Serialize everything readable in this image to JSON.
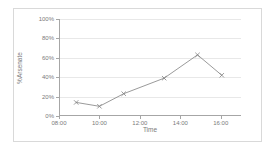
{
  "chart_data": {
    "type": "line",
    "title": "",
    "xlabel": "Time",
    "ylabel": "%Arsenate",
    "xlim": [
      8,
      17
    ],
    "ylim": [
      0,
      100
    ],
    "grid": true,
    "legend": false,
    "y_ticks": [
      "0%",
      "20%",
      "40%",
      "60%",
      "80%",
      "100%"
    ],
    "y_tick_values": [
      0,
      20,
      40,
      60,
      80,
      100
    ],
    "x_ticks": [
      "08:00",
      "10:00",
      "12:00",
      "14:00",
      "16:00"
    ],
    "x_tick_values": [
      8,
      10,
      12,
      14,
      16
    ],
    "marker": "x",
    "series": [
      {
        "name": "%Arsenate",
        "color": "#808080",
        "x": [
          8.85,
          10.0,
          11.2,
          13.2,
          14.85,
          16.05
        ],
        "x_labels": [
          "08:51",
          "10:00",
          "11:12",
          "13:12",
          "14:51",
          "16:03"
        ],
        "values": [
          14,
          10,
          23,
          39,
          63,
          42
        ]
      }
    ]
  },
  "colors": {
    "line": "#808080",
    "grid": "#e8e8e8",
    "axis": "#a6a6a6",
    "text": "#7a7a7a",
    "border": "#d9d9d9",
    "background": "#ffffff"
  }
}
